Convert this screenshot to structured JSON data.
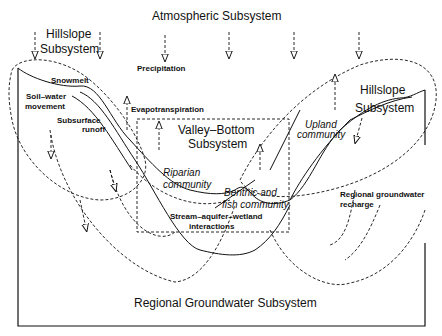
{
  "diagram": {
    "title_top": "Atmospheric Subsystem",
    "hillslope_left": {
      "line1": "Hillslope",
      "line2": "Subsystem"
    },
    "hillslope_right": {
      "line1": "Hillslope",
      "line2": "Subsystem"
    },
    "valley_bottom": {
      "line1": "Valley–Bottom",
      "line2": "Subsystem"
    },
    "regional": "Regional Groundwater Subsystem",
    "labels": {
      "precipitation": "Precipitation",
      "snowmelt": "Snowmelt",
      "soil_water_1": "Soil–water",
      "soil_water_2": "movement",
      "subsurface_1": "Subsurface",
      "subsurface_2": "runoff",
      "evapotranspiration": "Evapotranspiration",
      "riparian_1": "Riparian",
      "riparian_2": "community",
      "benthic_1": "Benthic and",
      "benthic_2": "fish community",
      "upland_1": "Upland",
      "upland_2": "community",
      "stream_1": "Stream–aquifer–wetland",
      "stream_2": "interactions",
      "recharge_1": "Regional groundwater",
      "recharge_2": "recharge"
    },
    "colors": {
      "line": "#111111",
      "background": "#ffffff"
    }
  }
}
